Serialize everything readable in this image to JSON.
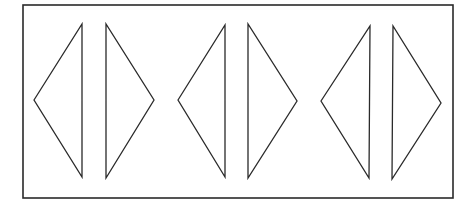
{
  "figure": {
    "stroke_color": "#2a2a2a",
    "background": "#ffffff",
    "frame": {
      "x1": 23,
      "y1": 5,
      "x2": 453,
      "y2": 198
    },
    "triangles": [
      {
        "direction": "left",
        "points": "34,100 82,24 82,177"
      },
      {
        "direction": "right",
        "points": "106,24 106,178 154,100"
      },
      {
        "direction": "left",
        "points": "178,100 225,25 225,177"
      },
      {
        "direction": "right",
        "points": "248,24 248,178 297,101"
      },
      {
        "direction": "left",
        "points": "321,101 370,26 369,178"
      },
      {
        "direction": "right",
        "points": "393,26 392,179 441,103"
      }
    ]
  }
}
